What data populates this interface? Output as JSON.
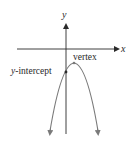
{
  "diagram": {
    "type": "parabola-graph",
    "axes": {
      "x_label": "x",
      "y_label": "y"
    },
    "labels": {
      "vertex": "vertex",
      "y_intercept_var": "y",
      "y_intercept_rest": "-intercept"
    },
    "colors": {
      "axis": "#2a2a2a",
      "curve": "#7a7a7a",
      "text": "#2a2a2a"
    },
    "opens": "down"
  }
}
